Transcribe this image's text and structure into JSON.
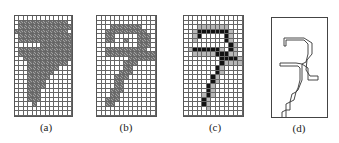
{
  "panels": [
    {
      "id": "a",
      "label": "(a)",
      "description": "filled gray digit 7 bitmap",
      "cols": 13,
      "rows": 22,
      "bitmap": [
        ".............",
        ".ggggggggggg.",
        ".gggggggggggg",
        "gggggggggggg.",
        ".gggggggggggg",
        ".gggggggggggg",
        "......ggggggg",
        ".gggggggggggg",
        ".gggggggggggg",
        "..ggggggggggg",
        "...ggggggggg.",
        "...ggggggg...",
        "...gggggg....",
        "...ggggg.....",
        "...gggg......",
        "...gggg......",
        "...ggg.......",
        "...ggg.......",
        "...ggg.......",
        "....g........",
        ".............",
        "............."
      ]
    },
    {
      "id": "b",
      "label": "(b)",
      "description": "thinned gray digit 7 bitmap",
      "cols": 13,
      "rows": 22,
      "bitmap": [
        ".............",
        ".............",
        "...ggggggg...",
        "..ggggggggg..",
        "..gg.....ggg.",
        "..gg..g..ggg.",
        ".........ggg.",
        "..ggggggggg..",
        "..ggggggggggg",
        ".......gggggg",
        "......ggg....",
        "......gg.....",
        ".....ggg.....",
        "....ggg......",
        "....gg.......",
        "....gg.......",
        "...ggg.......",
        "...gg........",
        "..ggg........",
        "..gg.........",
        ".............",
        "............."
      ]
    },
    {
      "id": "c",
      "label": "(c)",
      "description": "skeleton digit 7 with black core and gray border",
      "cols": 13,
      "rows": 22,
      "bitmap": [
        ".............",
        ".............",
        "...lllllll...",
        "..lkkkkkkkl..",
        "..lk.....kl..",
        "..l......kl..",
        "..........kl.",
        ".lkkkkkkl.kl.",
        "..lllllkkkll.",
        "........kkkkl",
        "........kllll",
        ".......kl....",
        ".......kl....",
        "......kl.....",
        "......kl.....",
        ".....kl......",
        ".....kl......",
        "....lkl......",
        "....kl.......",
        "....kl.......",
        ".....l.......",
        "............."
      ]
    },
    {
      "id": "d",
      "label": "(d)",
      "description": "contour outline of digit 7 skeleton",
      "polyline": "12,28 12,20 32,20 40,25 40,36 35,42 34,52 38,58 46,58 46,62 36,62 36,50 30,46 30,62 26,72 24,74 22,82 18,84 18,92 14,92 14,102 10,102 10,94 14,92 14,86 18,84 20,76 24,74 26,70 28,62 28,50 26,48 8,48 8,45 24,45 30,46 34,44 36,36 36,26 32,22 14,22 14,28 12,28"
    }
  ]
}
